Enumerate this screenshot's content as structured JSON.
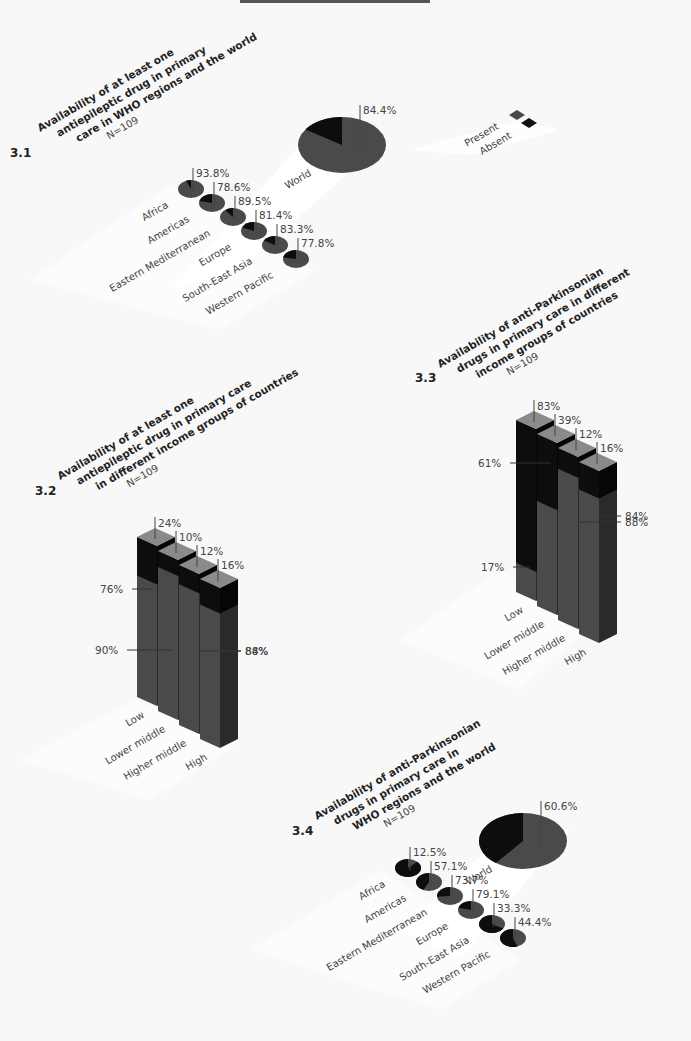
{
  "page": {
    "background": "#f8f8f8"
  },
  "colors": {
    "present": "#4a4a4a",
    "absent": "#0d0d0d",
    "present_top": "#8a8a8a",
    "absent_side": "#1a1a1a"
  },
  "legend": {
    "items": [
      {
        "label": "Present",
        "color": "#4a4a4a"
      },
      {
        "label": "Absent",
        "color": "#111111"
      }
    ]
  },
  "fig31": {
    "number": "3.1",
    "title_lines": [
      "Availability of at least one",
      "antiepileptic drug in primary",
      "care in WHO regions and the world"
    ],
    "n": "N=109"
  },
  "fig32": {
    "number": "3.2",
    "title_lines": [
      "Availability of at least one",
      "antiepileptic drug in primary care",
      "in different income groups of countries"
    ],
    "n": "N=109"
  },
  "fig33": {
    "number": "3.3",
    "title_lines": [
      "Availability of anti-Parkinsonian",
      "drugs in primary care in different",
      "income groups of countries"
    ],
    "n": "N=109"
  },
  "fig34": {
    "number": "3.4",
    "title_lines": [
      "Availability of anti-Parkinsonian",
      "drugs in primary care in",
      "WHO regions and the world"
    ],
    "n": "N=109"
  },
  "chart_data": [
    {
      "type": "pie",
      "id": "3.1",
      "title": "Availability of at least one antiepileptic drug in primary care in WHO regions and the world",
      "subtitle": "N=109",
      "categories": [
        "World",
        "Africa",
        "Americas",
        "Eastern Mediterranean",
        "Europe",
        "South-East Asia",
        "Western Pacific"
      ],
      "series": [
        {
          "name": "Present",
          "values": [
            84.4,
            93.8,
            78.6,
            89.5,
            81.4,
            83.3,
            77.8
          ]
        }
      ],
      "labels": [
        "84.4%",
        "93.8%",
        "78.6%",
        "89.5%",
        "81.4%",
        "83.3%",
        "77.8%"
      ],
      "legend": [
        "Present",
        "Absent"
      ]
    },
    {
      "type": "bar",
      "id": "3.2",
      "title": "Availability of at least one antiepileptic drug in primary care in different income groups of countries",
      "subtitle": "N=109",
      "categories": [
        "Low",
        "Lower middle",
        "Higher middle",
        "High"
      ],
      "series": [
        {
          "name": "Present",
          "values": [
            76,
            90,
            88,
            84
          ],
          "labels": [
            "76%",
            "90%",
            "88%",
            "84%"
          ]
        },
        {
          "name": "Absent",
          "values": [
            24,
            10,
            12,
            16
          ],
          "labels": [
            "24%",
            "10%",
            "12%",
            "16%"
          ]
        }
      ],
      "stacked": true,
      "ylim": [
        0,
        100
      ]
    },
    {
      "type": "bar",
      "id": "3.3",
      "title": "Availability of anti-Parkinsonian drugs in primary care in different income groups of countries",
      "subtitle": "N=109",
      "categories": [
        "Low",
        "Lower middle",
        "Higher middle",
        "High"
      ],
      "series": [
        {
          "name": "Present",
          "values": [
            17,
            61,
            88,
            84
          ],
          "labels": [
            "17%",
            "61%",
            "88%",
            "84%"
          ]
        },
        {
          "name": "Absent",
          "values": [
            83,
            39,
            12,
            16
          ],
          "labels": [
            "83%",
            "39%",
            "12%",
            "16%"
          ]
        }
      ],
      "stacked": true,
      "ylim": [
        0,
        100
      ]
    },
    {
      "type": "pie",
      "id": "3.4",
      "title": "Availability of anti-Parkinsonian drugs in primary care in WHO regions and the world",
      "subtitle": "N=109",
      "categories": [
        "World",
        "Africa",
        "Americas",
        "Eastern Mediterranean",
        "Europe",
        "South-East Asia",
        "Western Pacific"
      ],
      "series": [
        {
          "name": "Present",
          "values": [
            60.6,
            12.5,
            57.1,
            73.7,
            79.1,
            33.3,
            44.4
          ]
        }
      ],
      "labels": [
        "60.6%",
        "12.5%",
        "57.1%",
        "73.7%",
        "79.1%",
        "33.3%",
        "44.4%"
      ]
    }
  ]
}
